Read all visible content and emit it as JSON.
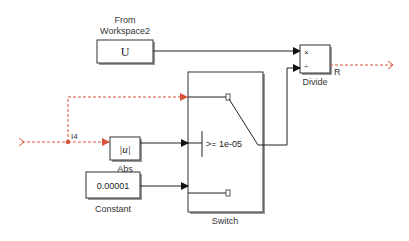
{
  "diagram": {
    "blocks": {
      "from_workspace": {
        "label_line1": "From",
        "label_line2": "Workspace2",
        "content": "U"
      },
      "divide": {
        "label": "Divide",
        "port1": "×",
        "port2": "÷",
        "output_label": "R"
      },
      "switch": {
        "label": "Switch",
        "criteria": ">= 1e-05"
      },
      "abs": {
        "label": "Abs",
        "content": "|u|"
      },
      "constant": {
        "label": "Constant",
        "content": "0.00001"
      }
    },
    "signals": {
      "input_label": "I4"
    },
    "colors": {
      "signal_red": "#d9513a",
      "wire": "#222222"
    }
  }
}
